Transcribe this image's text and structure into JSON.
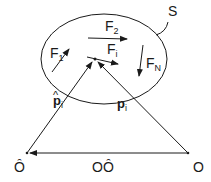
{
  "diagram": {
    "region": {
      "label": "S"
    },
    "forces": [
      {
        "label": "F",
        "sub": "1"
      },
      {
        "label": "F",
        "sub": "2"
      },
      {
        "label": "F",
        "sub": "i"
      },
      {
        "label": "F",
        "sub": "N"
      }
    ],
    "position_vectors": [
      {
        "label": "p",
        "hat": "^",
        "sub": "i"
      },
      {
        "label": "p",
        "sub": "i"
      }
    ],
    "points": [
      {
        "label": "Ô"
      },
      {
        "label": "O"
      }
    ],
    "origin_offset": {
      "label": "OÔ"
    },
    "colors": {
      "stroke": "#1a1a1a",
      "background": "#ffffff"
    }
  }
}
